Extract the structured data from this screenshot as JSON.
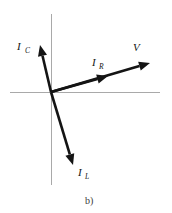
{
  "figure": {
    "caption": "b)",
    "background_color": "#ffffff",
    "axis_color": "#a9a9a9",
    "phasor_color": "#141414",
    "label_color": "#141414",
    "caption_color": "#3a3a3a"
  },
  "axes": {
    "origin": {
      "x": 51,
      "y": 92
    },
    "horizontal": {
      "x1": 10,
      "y1": 92,
      "x2": 160,
      "y2": 92
    },
    "vertical": {
      "x1": 51,
      "y1": 14,
      "x2": 51,
      "y2": 185
    }
  },
  "chart_data": {
    "type": "scatter",
    "title": "b)",
    "xlabel": "",
    "ylabel": "",
    "diagram_kind": "phasor-diagram",
    "origin": {
      "x": 51,
      "y": 92
    },
    "legend_position": "none",
    "grid": false,
    "series": [
      {
        "name": "I_C",
        "label": "I",
        "subscript": "C",
        "tip": {
          "x": 40,
          "y": 45
        },
        "angle_deg": 103.4,
        "magnitude": 48.2,
        "label_pos": {
          "x": 17,
          "y": 50
        },
        "sub_pos": {
          "x": 25,
          "y": 53
        }
      },
      {
        "name": "I_R",
        "label": "I",
        "subscript": "R",
        "tip": {
          "x": 108,
          "y": 76
        },
        "angle_deg": 15.7,
        "magnitude": 59.2,
        "label_pos": {
          "x": 92,
          "y": 66
        },
        "sub_pos": {
          "x": 99,
          "y": 69
        }
      },
      {
        "name": "V",
        "label": "V",
        "subscript": "",
        "tip": {
          "x": 150,
          "y": 63
        },
        "angle_deg": 16.3,
        "magnitude": 103.1,
        "label_pos": {
          "x": 133,
          "y": 51
        },
        "sub_pos": {
          "x": 0,
          "y": 0
        }
      },
      {
        "name": "I_L",
        "label": "I",
        "subscript": "L",
        "tip": {
          "x": 73,
          "y": 165
        },
        "angle_deg": -72.7,
        "magnitude": 76.5,
        "label_pos": {
          "x": 78,
          "y": 176
        },
        "sub_pos": {
          "x": 85,
          "y": 179
        }
      }
    ]
  }
}
